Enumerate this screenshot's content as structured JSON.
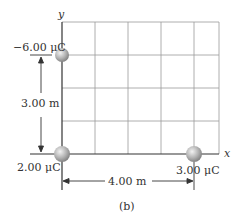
{
  "figure": {
    "caption": "(b)",
    "axes": {
      "x_label": "x",
      "y_label": "y"
    },
    "grid": {
      "columns": 5,
      "rows": 4
    },
    "charges": [
      {
        "id": "top",
        "label": "−6.00 μC",
        "position_m": [
          0,
          3
        ]
      },
      {
        "id": "origin",
        "label": "2.00 μC",
        "position_m": [
          0,
          0
        ]
      },
      {
        "id": "right",
        "label": "3.00 μC",
        "position_m": [
          4,
          0
        ]
      }
    ],
    "dimensions": {
      "vertical": "3.00 m",
      "horizontal": "4.00 m"
    },
    "colors": {
      "grid": "#9a9a9a",
      "axis": "#333333",
      "charge": "#a8a8a8"
    }
  }
}
